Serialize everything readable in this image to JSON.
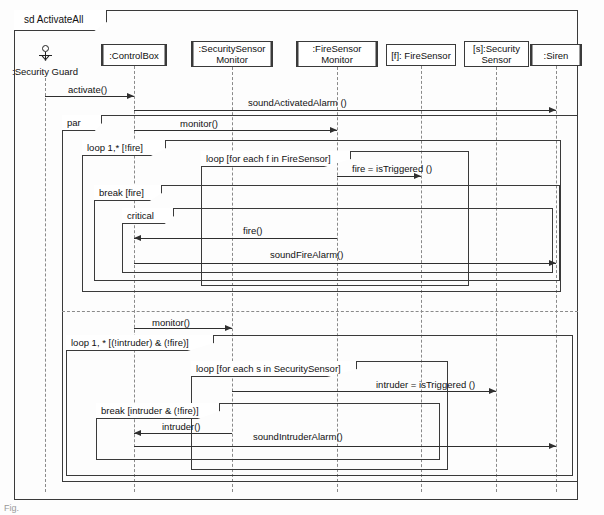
{
  "diagram": {
    "kind": "uml-sequence-diagram",
    "frame_label": "sd ActivateAll",
    "name": "ActivateAll"
  },
  "lifelines": [
    {
      "id": "guard",
      "label": ":Security Guard",
      "is_actor": true,
      "double_border": false,
      "x": 45,
      "box": {
        "left": 14,
        "top": 0,
        "w": 0,
        "h": 0
      }
    },
    {
      "id": "cbox",
      "label": ":ControlBox",
      "is_actor": false,
      "double_border": true,
      "x": 134,
      "box": {
        "left": 101,
        "top": 44,
        "w": 66,
        "h": 22
      }
    },
    {
      "id": "ssmon",
      "label": ":SecuritySensor\nMonitor",
      "is_actor": false,
      "double_border": true,
      "x": 232,
      "box": {
        "left": 191,
        "top": 41,
        "w": 82,
        "h": 26
      }
    },
    {
      "id": "fsmon",
      "label": ":FireSensor\nMonitor",
      "is_actor": false,
      "double_border": true,
      "x": 337,
      "box": {
        "left": 296,
        "top": 41,
        "w": 82,
        "h": 26
      }
    },
    {
      "id": "fsens",
      "label": "[f]: FireSensor",
      "is_actor": false,
      "double_border": false,
      "x": 421,
      "box": {
        "left": 386,
        "top": 44,
        "w": 70,
        "h": 22
      }
    },
    {
      "id": "ssens",
      "label": "[s]:Security\nSensor",
      "is_actor": false,
      "double_border": false,
      "x": 496,
      "box": {
        "left": 464,
        "top": 41,
        "w": 65,
        "h": 26
      }
    },
    {
      "id": "siren",
      "label": ":Siren",
      "is_actor": false,
      "double_border": true,
      "x": 556,
      "box": {
        "left": 530,
        "top": 44,
        "w": 52,
        "h": 22
      }
    }
  ],
  "fragments": [
    {
      "id": "par",
      "operator": "par",
      "tab_w": 40,
      "rect": {
        "left": 62,
        "top": 115,
        "w": 516,
        "h": 367
      }
    },
    {
      "id": "loopfire",
      "operator": "loop 1,* [!fire]",
      "tab_w": 84,
      "rect": {
        "left": 82,
        "top": 140,
        "w": 479,
        "h": 152
      }
    },
    {
      "id": "loopeachf",
      "operator": "loop [for each f in FireSensor]",
      "tab_w": 150,
      "rect": {
        "left": 201,
        "top": 151,
        "w": 268,
        "h": 135
      }
    },
    {
      "id": "breakfire",
      "operator": "break [fire]",
      "tab_w": 68,
      "rect": {
        "left": 94,
        "top": 185,
        "w": 466,
        "h": 96
      }
    },
    {
      "id": "critical",
      "operator": "critical",
      "tab_w": 52,
      "rect": {
        "left": 122,
        "top": 208,
        "w": 431,
        "h": 65
      }
    },
    {
      "id": "looploiter",
      "operator": "loop 1, * [(!intruder) & (!fire)]",
      "tab_w": 148,
      "rect": {
        "left": 66,
        "top": 335,
        "w": 507,
        "h": 141
      }
    },
    {
      "id": "loopeachs",
      "operator": "loop [for each s in SecuritySensor]",
      "tab_w": 166,
      "rect": {
        "left": 191,
        "top": 361,
        "w": 257,
        "h": 109
      }
    },
    {
      "id": "breakintr",
      "operator": "break [intruder & (!fire)]",
      "tab_w": 124,
      "rect": {
        "left": 96,
        "top": 403,
        "w": 344,
        "h": 57
      }
    }
  ],
  "par_divider_y": 311,
  "messages": [
    {
      "id": "m1",
      "label": "activate()",
      "from": "guard",
      "to": "cbox",
      "dir": "right",
      "y": 96,
      "label_x": 68,
      "label_y": 84
    },
    {
      "id": "m2",
      "label": "soundActivatedAlarm ()",
      "from": "cbox",
      "to": "siren",
      "dir": "right",
      "y": 110,
      "label_x": 248,
      "label_y": 97
    },
    {
      "id": "m3",
      "label": "monitor()",
      "from": "cbox",
      "to": "fsmon",
      "dir": "right",
      "y": 130,
      "label_x": 180,
      "label_y": 118
    },
    {
      "id": "m4",
      "label": "fire =  isTriggered ()",
      "from": "fsmon",
      "to": "fsens",
      "dir": "right",
      "y": 176,
      "label_x": 352,
      "label_y": 163
    },
    {
      "id": "m5",
      "label": "fire()",
      "from": "fsmon",
      "to": "cbox",
      "dir": "left",
      "y": 238,
      "label_x": 243,
      "label_y": 225
    },
    {
      "id": "m6",
      "label": "soundFireAlarm()",
      "from": "cbox",
      "to": "siren",
      "dir": "right",
      "y": 263,
      "label_x": 270,
      "label_y": 249
    },
    {
      "id": "m7",
      "label": "monitor()",
      "from": "cbox",
      "to": "ssmon",
      "dir": "right",
      "y": 328,
      "label_x": 152,
      "label_y": 317
    },
    {
      "id": "m8",
      "label": "intruder =  isTriggered ()",
      "from": "ssmon",
      "to": "ssens",
      "dir": "right",
      "y": 391,
      "label_x": 376,
      "label_y": 379
    },
    {
      "id": "m9",
      "label": "intruder()",
      "from": "ssmon",
      "to": "cbox",
      "dir": "left",
      "y": 433,
      "label_x": 162,
      "label_y": 421
    },
    {
      "id": "m10",
      "label": "soundIntruderAlarm()",
      "from": "cbox",
      "to": "siren",
      "dir": "right",
      "y": 446,
      "label_x": 253,
      "label_y": 431
    }
  ],
  "corner_marker": "Fig."
}
